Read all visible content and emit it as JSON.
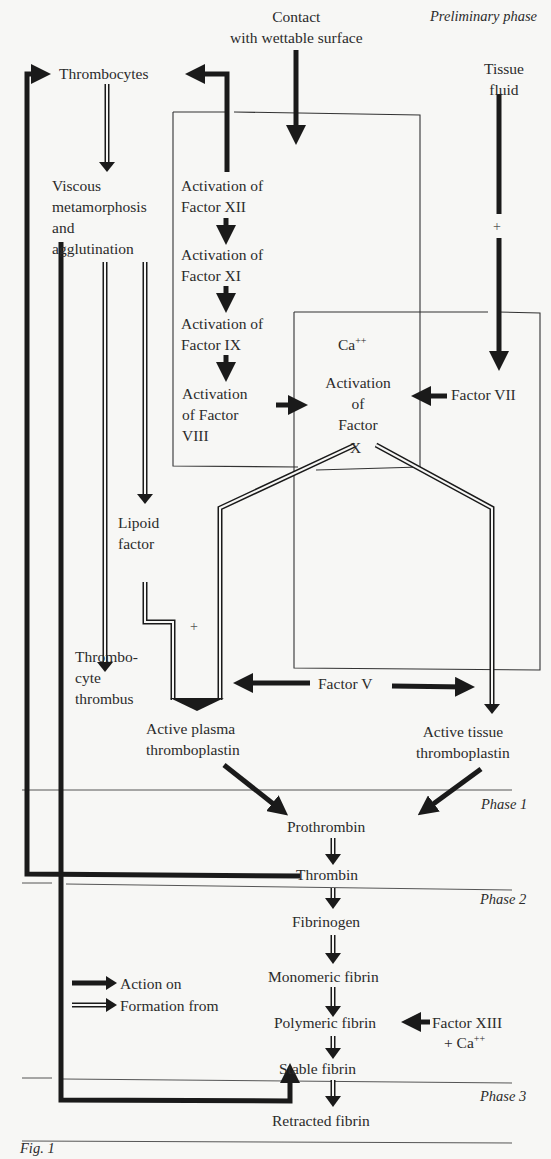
{
  "figure": {
    "caption": "Fig. 1",
    "phases": {
      "preliminary": "Preliminary phase",
      "phase1": "Phase 1",
      "phase2": "Phase 2",
      "phase3": "Phase 3"
    },
    "nodes": {
      "contact": "Contact\nwith wettable surface",
      "tissue_fluid": "Tissue\nfluid",
      "thrombocytes": "Thrombocytes",
      "viscous": "Viscous\nmetamorphosis\nand\nagglutination",
      "act_xii": "Activation of\nFactor XII",
      "act_xi": "Activation of\nFactor XI",
      "act_ix": "Activation of\nFactor IX",
      "act_viii": "Activation\nof Factor\nVIII",
      "ca_top": "Ca",
      "ca_top_sup": "++",
      "act_x": "Activation\nof\nFactor",
      "x_label": "X",
      "factor_vii": "Factor VII",
      "plus_tissue": "+",
      "lipoid": "Lipoid\nfactor",
      "plus_lipoid": "+",
      "thrombocyte_thrombus": "Thrombo-\ncyte\nthrombus",
      "factor_v": "Factor V",
      "active_plasma": "Active plasma\nthromboplastin",
      "active_tissue": "Active tissue\nthromboplastin",
      "prothrombin": "Prothrombin",
      "thrombin": "Thrombin",
      "fibrinogen": "Fibrinogen",
      "monomeric": "Monomeric fibrin",
      "polymeric": "Polymeric fibrin",
      "factor_xiii": "Factor XIII",
      "factor_xiii_ca": "+ Ca",
      "factor_xiii_ca_sup": "++",
      "stable": "Stable fibrin",
      "retracted": "Retracted fibrin"
    },
    "legend": {
      "action_on": "Action on",
      "formation_from": "Formation from"
    },
    "colors": {
      "ink": "#1a1a1a",
      "background": "#f7f7f5",
      "rule": "#555555"
    }
  }
}
